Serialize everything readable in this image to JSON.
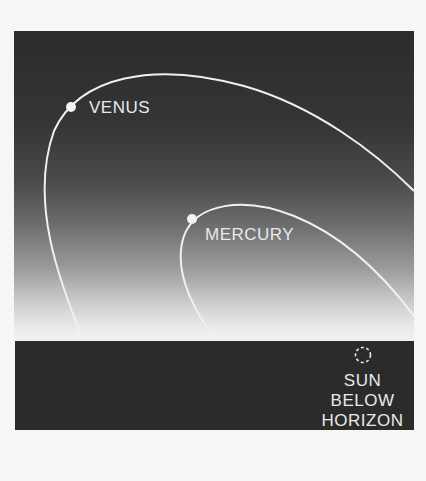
{
  "diagram": {
    "type": "sky-illustration",
    "colors": {
      "sky_top": "#2c2c2c",
      "sky_horizon": "#f2f2f2",
      "ground": "#2b2b2b",
      "orbit_line": "#f0f0f0",
      "label_text": "#e9e9e9"
    },
    "planets": [
      {
        "name": "VENUS",
        "label": "VENUS"
      },
      {
        "name": "MERCURY",
        "label": "MERCURY"
      }
    ],
    "sun": {
      "label_lines": [
        "SUN",
        "BELOW",
        "HORIZON"
      ],
      "icon": "dashed-circle-icon"
    }
  }
}
